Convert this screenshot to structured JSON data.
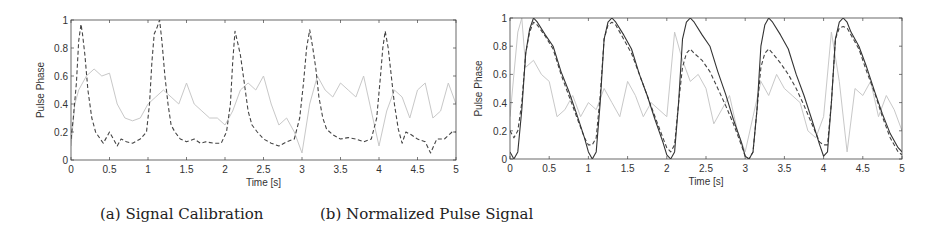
{
  "captions": {
    "a": "(a) Signal Calibration",
    "b": "(b) Normalized Pulse Signal"
  },
  "colors": {
    "axis": "#444444",
    "solid": "#333333",
    "dashed": "#444444",
    "light": "#c8c8c8"
  },
  "chart_data": [
    {
      "type": "line",
      "title": "(a) Signal Calibration",
      "xlabel": "Time [s]",
      "ylabel": "Pulse Phase",
      "xlim": [
        0,
        5
      ],
      "ylim": [
        0,
        1
      ],
      "xticks": [
        "0",
        "0.5",
        "1",
        "1.5",
        "2",
        "2.5",
        "3",
        "3.5",
        "4",
        "4.5",
        "5"
      ],
      "yticks": [
        "0",
        "0.2",
        "0.4",
        "0.6",
        "0.8",
        "1"
      ],
      "grid": false,
      "legend": null,
      "series": [
        {
          "name": "dashed",
          "style": "dashed-dark",
          "x": [
            0.0,
            0.03,
            0.07,
            0.1,
            0.13,
            0.15,
            0.18,
            0.22,
            0.27,
            0.32,
            0.38,
            0.42,
            0.5,
            0.55,
            0.6,
            0.65,
            0.72,
            0.8,
            0.9,
            0.98,
            1.02,
            1.05,
            1.08,
            1.12,
            1.15,
            1.18,
            1.22,
            1.26,
            1.3,
            1.35,
            1.42,
            1.5,
            1.6,
            1.68,
            1.75,
            1.85,
            1.95,
            2.02,
            2.07,
            2.1,
            2.13,
            2.16,
            2.2,
            2.25,
            2.3,
            2.35,
            2.42,
            2.5,
            2.6,
            2.7,
            2.8,
            2.9,
            2.97,
            3.02,
            3.06,
            3.1,
            3.14,
            3.18,
            3.22,
            3.27,
            3.32,
            3.4,
            3.5,
            3.6,
            3.7,
            3.8,
            3.9,
            3.97,
            4.02,
            4.05,
            4.08,
            4.12,
            4.16,
            4.2,
            4.25,
            4.3,
            4.35,
            4.42,
            4.5,
            4.6,
            4.67,
            4.75,
            4.85,
            4.95,
            5.0
          ],
          "y": [
            0.15,
            0.3,
            0.55,
            0.85,
            0.97,
            0.9,
            0.75,
            0.5,
            0.3,
            0.2,
            0.15,
            0.12,
            0.2,
            0.15,
            0.1,
            0.15,
            0.13,
            0.12,
            0.15,
            0.2,
            0.4,
            0.7,
            0.9,
            0.95,
            1.0,
            0.85,
            0.6,
            0.4,
            0.25,
            0.2,
            0.15,
            0.13,
            0.15,
            0.12,
            0.13,
            0.12,
            0.12,
            0.2,
            0.4,
            0.7,
            0.92,
            0.85,
            0.75,
            0.55,
            0.35,
            0.25,
            0.2,
            0.15,
            0.12,
            0.1,
            0.13,
            0.15,
            0.3,
            0.55,
            0.8,
            0.93,
            0.8,
            0.65,
            0.45,
            0.3,
            0.22,
            0.18,
            0.15,
            0.16,
            0.15,
            0.13,
            0.15,
            0.3,
            0.6,
            0.8,
            0.92,
            0.8,
            0.6,
            0.4,
            0.22,
            0.12,
            0.2,
            0.18,
            0.15,
            0.13,
            0.05,
            0.15,
            0.15,
            0.2,
            0.2
          ]
        },
        {
          "name": "light",
          "style": "solid-light",
          "x": [
            0.0,
            0.05,
            0.1,
            0.2,
            0.3,
            0.4,
            0.5,
            0.6,
            0.7,
            0.8,
            0.9,
            1.0,
            1.1,
            1.2,
            1.3,
            1.4,
            1.5,
            1.6,
            1.7,
            1.8,
            1.9,
            2.0,
            2.1,
            2.2,
            2.3,
            2.4,
            2.5,
            2.6,
            2.7,
            2.8,
            2.9,
            3.0,
            3.1,
            3.2,
            3.3,
            3.4,
            3.5,
            3.6,
            3.7,
            3.8,
            3.9,
            4.0,
            4.1,
            4.2,
            4.3,
            4.4,
            4.5,
            4.6,
            4.7,
            4.8,
            4.9,
            5.0
          ],
          "y": [
            0.1,
            0.4,
            0.5,
            0.6,
            0.65,
            0.6,
            0.62,
            0.4,
            0.3,
            0.28,
            0.3,
            0.4,
            0.45,
            0.5,
            0.45,
            0.4,
            0.55,
            0.4,
            0.35,
            0.3,
            0.3,
            0.25,
            0.35,
            0.5,
            0.55,
            0.5,
            0.6,
            0.4,
            0.25,
            0.3,
            0.2,
            0.05,
            0.4,
            0.6,
            0.5,
            0.45,
            0.55,
            0.5,
            0.45,
            0.6,
            0.35,
            0.1,
            0.35,
            0.5,
            0.45,
            0.3,
            0.5,
            0.55,
            0.3,
            0.35,
            0.55,
            0.4
          ]
        }
      ]
    },
    {
      "type": "line",
      "title": "(b) Normalized Pulse Signal",
      "xlabel": "Time [s]",
      "ylabel": "Pulse Phase",
      "xlim": [
        0,
        5
      ],
      "ylim": [
        0,
        1
      ],
      "xticks": [
        "0",
        "0.5",
        "1",
        "1.5",
        "2",
        "2.5",
        "3",
        "3.5",
        "4",
        "4.5",
        "5"
      ],
      "yticks": [
        "0",
        "0.2",
        "0.4",
        "0.6",
        "0.8",
        "1"
      ],
      "grid": false,
      "legend": null,
      "series": [
        {
          "name": "solid",
          "style": "solid-dark",
          "x": [
            0.0,
            0.05,
            0.1,
            0.15,
            0.2,
            0.25,
            0.3,
            0.35,
            0.45,
            0.55,
            0.65,
            0.75,
            0.85,
            0.95,
            1.0,
            1.05,
            1.1,
            1.15,
            1.2,
            1.25,
            1.3,
            1.35,
            1.45,
            1.55,
            1.65,
            1.75,
            1.85,
            1.95,
            2.0,
            2.05,
            2.1,
            2.15,
            2.2,
            2.25,
            2.3,
            2.35,
            2.45,
            2.55,
            2.65,
            2.75,
            2.85,
            2.95,
            3.0,
            3.05,
            3.1,
            3.15,
            3.2,
            3.25,
            3.3,
            3.35,
            3.45,
            3.55,
            3.65,
            3.75,
            3.85,
            3.95,
            4.0,
            4.05,
            4.1,
            4.15,
            4.2,
            4.25,
            4.3,
            4.35,
            4.45,
            4.55,
            4.65,
            4.75,
            4.85,
            4.95,
            5.0
          ],
          "y": [
            0.05,
            0.0,
            0.05,
            0.35,
            0.75,
            0.92,
            1.0,
            0.97,
            0.88,
            0.8,
            0.62,
            0.48,
            0.32,
            0.15,
            0.05,
            0.0,
            0.05,
            0.4,
            0.85,
            0.97,
            1.0,
            0.97,
            0.88,
            0.78,
            0.6,
            0.45,
            0.28,
            0.12,
            0.03,
            0.0,
            0.05,
            0.4,
            0.85,
            0.97,
            1.0,
            0.97,
            0.88,
            0.8,
            0.62,
            0.46,
            0.28,
            0.12,
            0.02,
            0.0,
            0.05,
            0.35,
            0.8,
            0.95,
            1.0,
            0.97,
            0.88,
            0.78,
            0.6,
            0.45,
            0.28,
            0.1,
            0.02,
            0.05,
            0.4,
            0.85,
            0.97,
            1.0,
            0.97,
            0.9,
            0.8,
            0.65,
            0.48,
            0.32,
            0.18,
            0.08,
            0.05
          ]
        },
        {
          "name": "dashed",
          "style": "dashed-dark",
          "x": [
            0.0,
            0.05,
            0.1,
            0.15,
            0.2,
            0.25,
            0.3,
            0.35,
            0.45,
            0.55,
            0.65,
            0.75,
            0.85,
            0.95,
            1.0,
            1.05,
            1.1,
            1.15,
            1.2,
            1.25,
            1.3,
            1.35,
            1.45,
            1.55,
            1.65,
            1.75,
            1.85,
            1.95,
            2.0,
            2.05,
            2.1,
            2.15,
            2.2,
            2.25,
            2.3,
            2.35,
            2.45,
            2.55,
            2.65,
            2.75,
            2.85,
            2.95,
            3.0,
            3.05,
            3.1,
            3.15,
            3.2,
            3.25,
            3.3,
            3.35,
            3.45,
            3.55,
            3.65,
            3.75,
            3.85,
            3.95,
            4.0,
            4.05,
            4.1,
            4.15,
            4.2,
            4.25,
            4.3,
            4.35,
            4.45,
            4.55,
            4.65,
            4.75,
            4.85,
            4.95,
            5.0
          ],
          "y": [
            0.2,
            0.15,
            0.2,
            0.4,
            0.75,
            0.9,
            0.97,
            0.95,
            0.87,
            0.78,
            0.6,
            0.45,
            0.3,
            0.15,
            0.1,
            0.1,
            0.15,
            0.45,
            0.85,
            0.95,
            0.97,
            0.95,
            0.85,
            0.75,
            0.6,
            0.45,
            0.3,
            0.15,
            0.08,
            0.05,
            0.1,
            0.4,
            0.65,
            0.75,
            0.78,
            0.75,
            0.7,
            0.62,
            0.5,
            0.38,
            0.25,
            0.1,
            0.02,
            0.0,
            0.05,
            0.35,
            0.65,
            0.75,
            0.78,
            0.75,
            0.68,
            0.6,
            0.5,
            0.38,
            0.25,
            0.12,
            0.1,
            0.1,
            0.4,
            0.85,
            0.93,
            0.94,
            0.93,
            0.88,
            0.78,
            0.62,
            0.47,
            0.3,
            0.15,
            0.05,
            0.03
          ]
        },
        {
          "name": "light",
          "style": "solid-light",
          "x": [
            0.0,
            0.05,
            0.1,
            0.15,
            0.2,
            0.3,
            0.4,
            0.5,
            0.6,
            0.7,
            0.8,
            0.9,
            1.0,
            1.1,
            1.2,
            1.3,
            1.4,
            1.5,
            1.6,
            1.7,
            1.8,
            1.9,
            2.0,
            2.1,
            2.2,
            2.3,
            2.4,
            2.5,
            2.6,
            2.7,
            2.8,
            2.9,
            3.0,
            3.1,
            3.2,
            3.3,
            3.4,
            3.5,
            3.6,
            3.7,
            3.8,
            3.9,
            4.0,
            4.1,
            4.2,
            4.3,
            4.4,
            4.5,
            4.6,
            4.7,
            4.8,
            4.9,
            5.0
          ],
          "y": [
            0.3,
            0.6,
            0.9,
            1.0,
            0.65,
            0.7,
            0.6,
            0.55,
            0.3,
            0.35,
            0.45,
            0.3,
            0.4,
            0.35,
            0.5,
            0.4,
            0.3,
            0.55,
            0.45,
            0.3,
            0.4,
            0.35,
            0.3,
            0.9,
            0.7,
            0.55,
            0.6,
            0.5,
            0.25,
            0.35,
            0.45,
            0.2,
            0.05,
            0.3,
            0.55,
            0.45,
            0.6,
            0.5,
            0.45,
            0.4,
            0.2,
            0.15,
            0.3,
            0.9,
            0.55,
            0.05,
            0.5,
            0.45,
            0.55,
            0.3,
            0.45,
            0.35,
            0.2
          ]
        }
      ]
    }
  ]
}
